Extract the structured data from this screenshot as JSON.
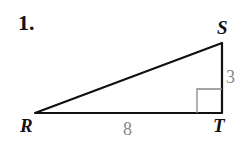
{
  "problem": {
    "number": "1.",
    "vertices": {
      "R": "R",
      "S": "S",
      "T": "T"
    },
    "sides": {
      "ST": "3",
      "RT": "8"
    },
    "right_angle_at": "T",
    "colors": {
      "lines": "#111111",
      "side_labels": "#888888",
      "right_angle_mark": "#888888"
    }
  }
}
